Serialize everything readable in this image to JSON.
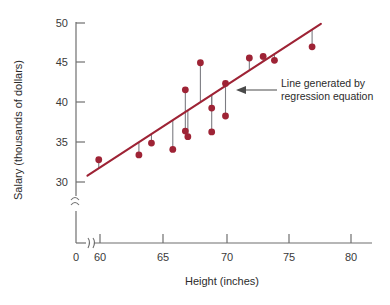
{
  "chart_data": {
    "type": "scatter",
    "title": "",
    "xlabel": "Height (inches)",
    "ylabel": "Salary (thousands of dollars)",
    "xlim": [
      57.5,
      81.5
    ],
    "ylim": [
      29.2,
      50.5
    ],
    "x_ticks": [
      60,
      65,
      70,
      75,
      80
    ],
    "x_tick_labels": [
      "60",
      "65",
      "70",
      "75",
      "80"
    ],
    "x_origin_label": "0",
    "y_ticks": [
      30,
      35,
      40,
      45,
      50
    ],
    "y_tick_labels": [
      "30",
      "35",
      "40",
      "45",
      "50"
    ],
    "grid": false,
    "legend": null,
    "axis_break_x": true,
    "axis_break_y": true,
    "point_color": "#9e2335",
    "line_color": "#9e2335",
    "residual_color": "#7c7c82",
    "series": [
      {
        "name": "Height vs Salary observations",
        "x": [
          59.9,
          63.1,
          64.1,
          65.8,
          66.8,
          66.8,
          67.0,
          68.0,
          68.9,
          68.9,
          70.0,
          70.0,
          71.9,
          73.0,
          73.9,
          76.9
        ],
        "y": [
          32.8,
          33.4,
          34.9,
          34.1,
          41.6,
          36.4,
          35.7,
          45.0,
          39.3,
          36.3,
          42.4,
          38.3,
          45.6,
          45.8,
          45.3,
          47.0
        ]
      }
    ],
    "regression_line": {
      "label": "Line generated by regression equation",
      "x_start": 59.0,
      "y_start": 30.8,
      "x_end": 77.6,
      "y_end": 49.9
    },
    "residual_segments": [
      {
        "x": 59.9,
        "y_point": 32.8,
        "y_line": 31.7
      },
      {
        "x": 63.1,
        "y_point": 33.4,
        "y_line": 35.0
      },
      {
        "x": 64.1,
        "y_point": 34.9,
        "y_line": 36.1
      },
      {
        "x": 65.8,
        "y_point": 34.1,
        "y_line": 37.8
      },
      {
        "x": 66.8,
        "y_point": 41.6,
        "y_line": 38.8
      },
      {
        "x": 66.8,
        "y_point": 36.4,
        "y_line": 38.8
      },
      {
        "x": 67.0,
        "y_point": 35.7,
        "y_line": 39.0
      },
      {
        "x": 68.0,
        "y_point": 45.0,
        "y_line": 40.1
      },
      {
        "x": 68.9,
        "y_point": 39.3,
        "y_line": 41.0
      },
      {
        "x": 68.9,
        "y_point": 36.3,
        "y_line": 41.0
      },
      {
        "x": 70.0,
        "y_point": 42.4,
        "y_line": 42.1
      },
      {
        "x": 70.0,
        "y_point": 38.3,
        "y_line": 42.1
      },
      {
        "x": 71.9,
        "y_point": 45.6,
        "y_line": 44.1
      },
      {
        "x": 73.0,
        "y_point": 45.8,
        "y_line": 45.2
      },
      {
        "x": 73.9,
        "y_point": 45.3,
        "y_line": 46.2
      },
      {
        "x": 76.9,
        "y_point": 47.0,
        "y_line": 49.2
      }
    ],
    "annotation": {
      "line1": "Line generated by",
      "line2": "regression equation",
      "arrow_target_x": 71.6,
      "arrow_target_y": 43.9
    }
  }
}
